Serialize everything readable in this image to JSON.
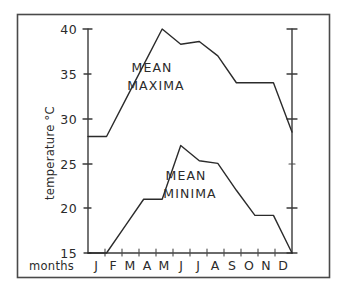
{
  "chart_data": {
    "type": "line",
    "title": "",
    "xlabel": "months",
    "ylabel": "temperature °C",
    "ylim": [
      15,
      40
    ],
    "xlim_categories": 12,
    "grid": false,
    "legend": "inline-annotations",
    "categories": [
      "J",
      "F",
      "M",
      "A",
      "M",
      "J",
      "J",
      "A",
      "S",
      "O",
      "N",
      "D"
    ],
    "y_ticks": [
      15,
      20,
      25,
      30,
      35,
      40
    ],
    "y_tick_labels": [
      "15",
      "20",
      "25",
      "30",
      "35",
      "40"
    ],
    "series": [
      {
        "name": "MEAN MAXIMA",
        "values": [
          28,
          28,
          32,
          36,
          40,
          38.3,
          38.6,
          37,
          34,
          34,
          34,
          28.5
        ]
      },
      {
        "name": "MEAN MINIMA",
        "values": [
          15,
          15,
          18,
          21,
          21,
          27,
          25.3,
          25,
          22,
          19.2,
          19.2,
          15
        ]
      }
    ],
    "annotations": [
      {
        "text_line1": "MEAN",
        "text_line2": "MAXIMA"
      },
      {
        "text_line1": "MEAN",
        "text_line2": "MINIMA"
      }
    ],
    "right_axis": {
      "visible": true,
      "labels_shown": false,
      "tick_values": [
        15,
        20,
        30,
        35,
        40
      ]
    }
  },
  "axes": {
    "y_axis_caption": "temperature °C",
    "x_axis_caption": "months"
  },
  "colors": {
    "line": "#2b2b2b",
    "axis": "#3a3a3a",
    "frame": "#4a4a4a",
    "background": "#ffffff",
    "text": "#2b2b2b"
  }
}
